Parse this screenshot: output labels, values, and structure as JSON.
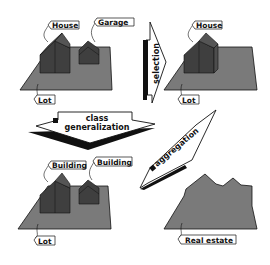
{
  "colors": {
    "lot": "#7a7a7a",
    "house_front": "#3f3f3f",
    "house_side": "#4d4d4d",
    "roof": "#555555",
    "outline": "#111111",
    "tag_bg": "#ffffff"
  },
  "panels": {
    "top_left": {
      "tags": {
        "house": "House",
        "garage": "Garage",
        "lot": "Lot"
      }
    },
    "top_right": {
      "tags": {
        "house": "House",
        "lot": "Lot"
      }
    },
    "bottom_left": {
      "tags": {
        "building_1": "Building",
        "building_2": "Building",
        "lot": "Lot"
      }
    },
    "bottom_right": {
      "tags": {
        "real_estate": "Real estate"
      }
    }
  },
  "arrows": {
    "selection": "selection",
    "class_generalization_line1": "class",
    "class_generalization_line2": "generalization",
    "aggregation": "aggregation"
  }
}
